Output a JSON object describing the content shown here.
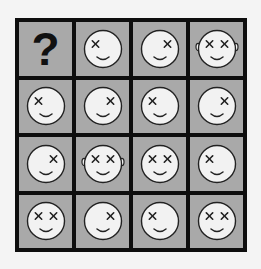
{
  "puzzle": {
    "rows": 4,
    "cols": 4,
    "colors": {
      "border": "#0e0e0e",
      "cell_bg": "#a9a9a9",
      "face_fill": "#f2f2f2",
      "stroke": "#222222",
      "page_bg": "#f4f4f4"
    },
    "cells": [
      {
        "type": "question",
        "label": "?"
      },
      {
        "type": "face",
        "eyes": "left",
        "ears": false
      },
      {
        "type": "face",
        "eyes": "right",
        "ears": false
      },
      {
        "type": "face",
        "eyes": "both",
        "ears": true
      },
      {
        "type": "face",
        "eyes": "left",
        "ears": false
      },
      {
        "type": "face",
        "eyes": "right",
        "ears": false
      },
      {
        "type": "face",
        "eyes": "left",
        "ears": false
      },
      {
        "type": "face",
        "eyes": "right",
        "ears": false
      },
      {
        "type": "face",
        "eyes": "right",
        "ears": false
      },
      {
        "type": "face",
        "eyes": "both",
        "ears": true
      },
      {
        "type": "face",
        "eyes": "both",
        "ears": false
      },
      {
        "type": "face",
        "eyes": "left",
        "ears": false
      },
      {
        "type": "face",
        "eyes": "both",
        "ears": false
      },
      {
        "type": "face",
        "eyes": "right",
        "ears": false
      },
      {
        "type": "face",
        "eyes": "left",
        "ears": false
      },
      {
        "type": "face",
        "eyes": "both",
        "ears": false
      }
    ]
  }
}
